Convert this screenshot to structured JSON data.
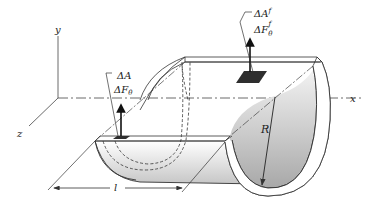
{
  "figure": {
    "axes": {
      "x_label": "x",
      "y_label": "y",
      "z_label": "z"
    },
    "labels": {
      "lower_area": "ΔA",
      "lower_force": "ΔF",
      "lower_force_sub": "θ",
      "upper_area": "ΔA",
      "upper_area_sup": "f",
      "upper_force": "ΔF",
      "upper_force_sub": "θ",
      "upper_force_sup": "f",
      "radius": "R",
      "length": "l"
    },
    "colors": {
      "line": "#333333",
      "shade_dark": "#a8a8a8",
      "shade_light": "#f4f4f4",
      "element_fill": "#3a3a3a"
    }
  }
}
